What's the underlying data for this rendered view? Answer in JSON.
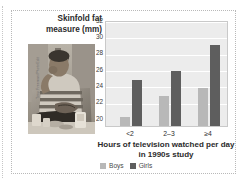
{
  "figure": {
    "photo_credit": "Tony Freeman/PhotoEdit",
    "photo_alt": "photo-person-eating-snacks-watching-television"
  },
  "chart_data": {
    "type": "bar",
    "title": "",
    "ylabel": "Skinfold fat measure (mm)",
    "xlabel": "Hours of television watched per day in 1990s study",
    "xlabel_line1": "Hours of television watched per day",
    "xlabel_line2": "in 1990s study",
    "categories": [
      "<2",
      "2–3",
      "≥4"
    ],
    "series": [
      {
        "name": "Boys",
        "color": "#b8b8b8",
        "values": [
          21.1,
          23.8,
          24.8
        ]
      },
      {
        "name": "Girls",
        "color": "#5e5e5e",
        "values": [
          25.7,
          26.9,
          30.1
        ]
      }
    ],
    "ylim": [
      20,
      33
    ],
    "yticks": [
      32,
      30,
      28,
      26,
      24,
      22,
      20
    ],
    "grid": true,
    "legend_position": "bottom"
  }
}
